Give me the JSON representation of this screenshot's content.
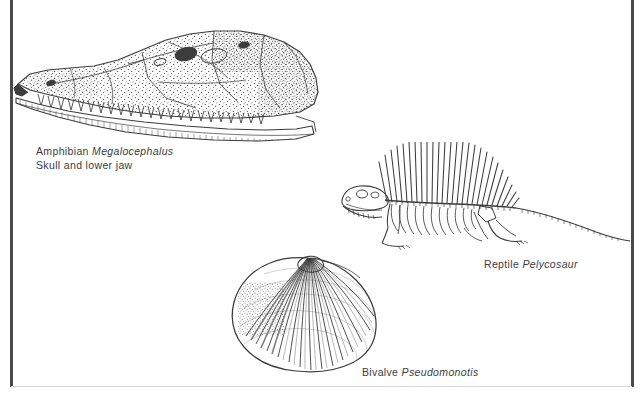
{
  "plate": {
    "background_color": "#ffffff",
    "ink_color": "#3c3c3c",
    "rule_color": "#4a4a4a"
  },
  "figures": [
    {
      "id": "amphibian",
      "icon": "fossil-skull-illustration",
      "common_name": "Amphibian",
      "species": "Megalocephalus",
      "detail_line": "Skull and lower jaw"
    },
    {
      "id": "reptile",
      "icon": "fossil-skeleton-illustration",
      "common_name": "Reptile",
      "species": "Pelycosaur",
      "detail_line": ""
    },
    {
      "id": "bivalve",
      "icon": "fossil-shell-illustration",
      "common_name": "Bivalve",
      "species": "Pseudomonotis",
      "detail_line": ""
    }
  ]
}
